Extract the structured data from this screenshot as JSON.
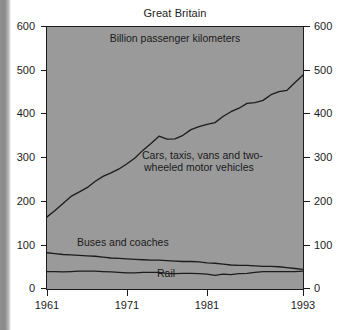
{
  "chart_data": {
    "type": "line",
    "title": "Great Britain",
    "subtitle": "Billion passenger kilometers",
    "xlabel": "",
    "ylabel": "",
    "xlim": [
      1961,
      1993
    ],
    "ylim": [
      0,
      600
    ],
    "grid": false,
    "legend_position": "inline-annotations",
    "y_ticks": [
      0,
      100,
      200,
      300,
      400,
      500,
      600
    ],
    "y_tick_labels_left": [
      "0",
      "100",
      "200",
      "300",
      "400",
      "500",
      "600"
    ],
    "y_tick_labels_right": [
      "0",
      "100",
      "200",
      "300",
      "400",
      "500",
      "600"
    ],
    "x_ticks": [
      1961,
      1971,
      1981,
      1993
    ],
    "x_tick_labels": [
      "1961",
      "1971",
      "1981",
      "1993"
    ],
    "x": [
      1961,
      1962,
      1963,
      1964,
      1965,
      1966,
      1967,
      1968,
      1969,
      1970,
      1971,
      1972,
      1973,
      1974,
      1975,
      1976,
      1977,
      1978,
      1979,
      1980,
      1981,
      1982,
      1983,
      1984,
      1985,
      1986,
      1987,
      1988,
      1989,
      1990,
      1991,
      1992,
      1993
    ],
    "series": [
      {
        "name": "Cars, taxis, vans and two-wheeled motor vehicles",
        "values": [
          165,
          180,
          196,
          212,
          222,
          232,
          246,
          258,
          266,
          275,
          287,
          300,
          318,
          333,
          350,
          343,
          344,
          352,
          365,
          372,
          377,
          381,
          395,
          406,
          414,
          425,
          427,
          432,
          445,
          452,
          455,
          473,
          490
        ]
      },
      {
        "name": "Buses and coaches",
        "values": [
          83,
          81,
          79,
          78,
          77,
          76,
          75,
          73,
          71,
          70,
          69,
          68,
          67,
          66,
          66,
          65,
          64,
          63,
          63,
          62,
          60,
          59,
          57,
          55,
          54,
          54,
          53,
          52,
          52,
          51,
          49,
          47,
          45
        ]
      },
      {
        "name": "Rail",
        "values": [
          40,
          40,
          39,
          40,
          41,
          41,
          41,
          40,
          39,
          38,
          37,
          37,
          38,
          38,
          38,
          36,
          35,
          36,
          36,
          35,
          34,
          31,
          34,
          33,
          35,
          36,
          38,
          40,
          40,
          40,
          40,
          40,
          41
        ]
      }
    ],
    "annotations": [
      {
        "text": "Billion passenger kilometers",
        "x": 1972.0,
        "y": 576
      },
      {
        "text": "Cars, taxis, vans and two-",
        "x": 1980.5,
        "y": 312
      },
      {
        "text": "wheeled motor vehicles",
        "x": 1980.0,
        "y": 287
      },
      {
        "text": "Buses and coaches",
        "x": 1970.0,
        "y": 104
      },
      {
        "text": "Rail",
        "x": 1974.5,
        "y": 30
      }
    ],
    "colors": {
      "plot_background": "#9a9a9a",
      "page_background": "#ffffff",
      "line": "#1c1c1c",
      "axis": "#1c1c1c",
      "text": "#1c1c1c"
    }
  }
}
